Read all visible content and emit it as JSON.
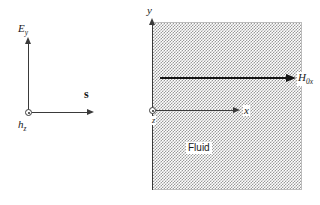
{
  "figure": {
    "title": "",
    "background_color": "#ffffff",
    "line_color": "#3a3a3a",
    "fluid_fill_color": "#9a9a9a"
  },
  "left_panel": {
    "name": "field-vector-axes",
    "vertical_axis": {
      "label_main": "E",
      "label_sub": "y",
      "direction": "up",
      "meaning": "electric-field-y-component"
    },
    "horizontal_axis": {
      "label_main": "s",
      "label_sub": "",
      "direction": "right",
      "meaning": "poynting-vector"
    },
    "origin": {
      "label_main": "h",
      "label_sub": "z",
      "marker": "circle-dot-out-of-page",
      "meaning": "magnetic-field-z-component-out-of-page"
    }
  },
  "right_panel": {
    "name": "fluid-region-axes",
    "vertical_axis": {
      "label_main": "y",
      "label_sub": "",
      "direction": "up"
    },
    "horizontal_axis": {
      "label_main": "x",
      "label_sub": "",
      "direction": "right"
    },
    "origin": {
      "label_main": "z",
      "label_sub": "",
      "marker": "circle-dot-out-of-page"
    },
    "field_arrow": {
      "label_main": "H",
      "label_sub": "0x",
      "direction": "right",
      "style": "bold"
    },
    "region_label": "Fluid"
  }
}
